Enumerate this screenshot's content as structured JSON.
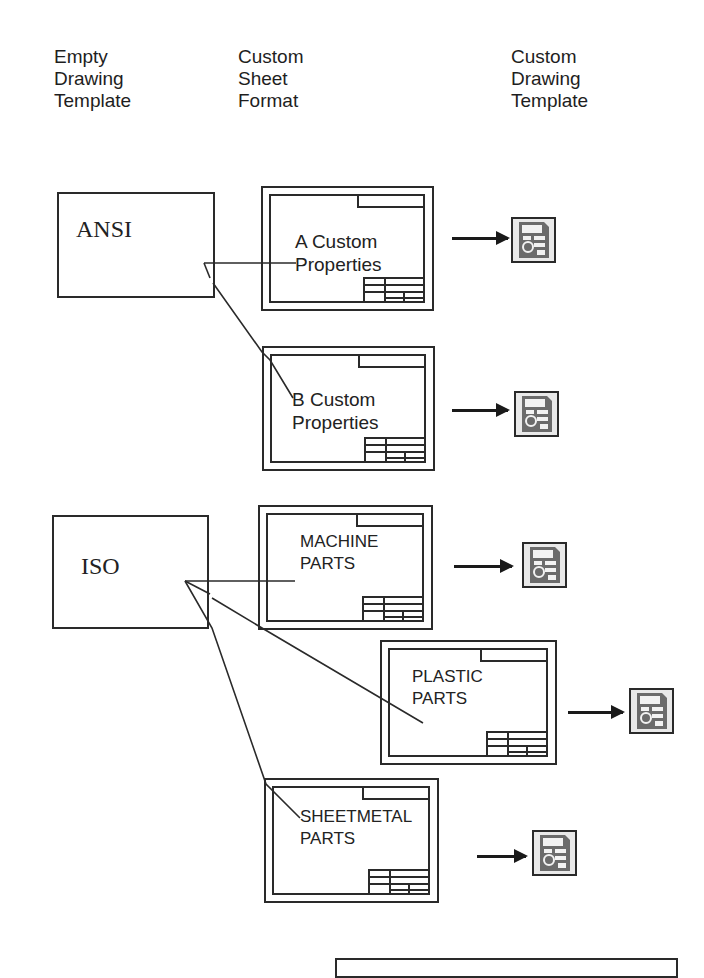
{
  "headers": {
    "empty_template": [
      "Empty",
      "Drawing",
      "Template"
    ],
    "sheet_format": [
      "Custom",
      "Sheet",
      "Format"
    ],
    "custom_template": [
      "Custom",
      "Drawing",
      "Template"
    ]
  },
  "templates": [
    {
      "label": "ANSI"
    },
    {
      "label": "ISO"
    }
  ],
  "sheets": [
    {
      "line1": "A Custom",
      "line2": "Properties",
      "parent": "ANSI"
    },
    {
      "line1": "B Custom",
      "line2": "Properties",
      "parent": "ANSI"
    },
    {
      "line1": "MACHINE",
      "line2": "PARTS",
      "parent": "ISO"
    },
    {
      "line1": "PLASTIC",
      "line2": "PARTS",
      "parent": "ISO"
    },
    {
      "line1": "SHEETMETAL",
      "line2": "PARTS",
      "parent": "ISO"
    }
  ],
  "outputs": [
    {
      "icon": "drawing-template-file-icon"
    },
    {
      "icon": "drawing-template-file-icon"
    },
    {
      "icon": "drawing-template-file-icon"
    },
    {
      "icon": "drawing-template-file-icon"
    },
    {
      "icon": "drawing-template-file-icon"
    }
  ],
  "colors": {
    "line": "#2a2a2a",
    "icon_bg": "#e9e9e9",
    "icon_dark": "#6b6b6b"
  }
}
